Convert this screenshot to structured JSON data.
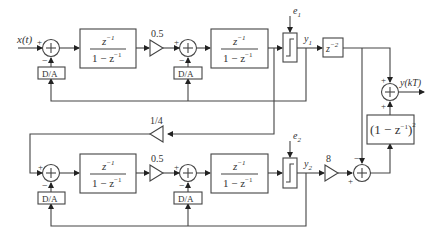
{
  "diagram": {
    "type": "block-diagram",
    "input_label": "x(t)",
    "output_label": "y(kT)",
    "stage1": {
      "integrator1": {
        "num": "z",
        "num_exp": "−1",
        "den": "1 − z",
        "den_exp": "−1"
      },
      "gain": "0.5",
      "integrator2": {
        "num": "z",
        "num_exp": "−1",
        "den": "1 − z",
        "den_exp": "−1"
      },
      "dac1": "D/A",
      "dac2": "D/A",
      "noise_label": "e",
      "noise_sub": "1",
      "output_label": "y",
      "output_sub": "1",
      "delay": {
        "base": "z",
        "exp": "−2"
      }
    },
    "coupling_gain": "1/4",
    "stage2": {
      "integrator1": {
        "num": "z",
        "num_exp": "−1",
        "den": "1 − z",
        "den_exp": "−1"
      },
      "gain": "0.5",
      "integrator2": {
        "num": "z",
        "num_exp": "−1",
        "den": "1 − z",
        "den_exp": "−1"
      },
      "dac1": "D/A",
      "dac2": "D/A",
      "noise_label": "e",
      "noise_sub": "2",
      "output_label": "y",
      "output_sub": "2",
      "gain_out": "8"
    },
    "noise_filter": {
      "text": "(1 − z",
      "exp": "−1",
      "close": ")",
      "power": "2"
    },
    "signs": {
      "plus": "+",
      "minus": "−"
    }
  }
}
